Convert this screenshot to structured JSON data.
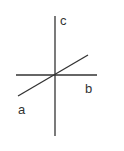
{
  "diagram": {
    "type": "three-lines-intersecting",
    "stroke_color": "#333333",
    "lines": [
      {
        "name": "c",
        "label": "c",
        "x1": 55,
        "y1": 16,
        "x2": 55,
        "y2": 136
      },
      {
        "name": "b",
        "label": "b",
        "x1": 16,
        "y1": 75,
        "x2": 97,
        "y2": 75
      },
      {
        "name": "a",
        "label": "a",
        "x1": 18,
        "y1": 96,
        "x2": 88,
        "y2": 55
      }
    ],
    "labels": {
      "c": "c",
      "b": "b",
      "a": "a"
    }
  }
}
